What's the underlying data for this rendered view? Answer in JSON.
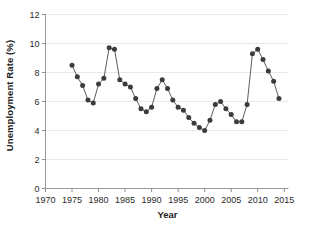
{
  "chart_data": {
    "type": "scatter",
    "title": "",
    "xlabel": "Year",
    "ylabel": "Unemployment Rate (%)",
    "xlim": [
      1970,
      2015.8
    ],
    "ylim": [
      0,
      12
    ],
    "xticks": [
      1970,
      1975,
      1980,
      1985,
      1990,
      1995,
      2000,
      2005,
      2010,
      2015
    ],
    "xtick_labels": [
      "1970",
      "1975",
      "1980",
      "1985",
      "1990",
      "1995",
      "2000",
      "2005",
      "2010",
      "2015"
    ],
    "yticks": [
      0,
      2,
      4,
      6,
      8,
      10,
      12
    ],
    "ytick_labels": [
      "0",
      "2",
      "4",
      "6",
      "8",
      "10",
      "12"
    ],
    "grid": "horizontal",
    "legend": "none",
    "marker": "filled-circle",
    "marker_color": "#3c3c3c",
    "line_color": "#4a4a4a",
    "grid_color": "#e9e9e9",
    "axis_color": "#9a9a9a",
    "x": [
      1975,
      1976,
      1977,
      1978,
      1979,
      1980,
      1981,
      1982,
      1983,
      1984,
      1985,
      1986,
      1987,
      1988,
      1989,
      1990,
      1991,
      1992,
      1993,
      1994,
      1995,
      1996,
      1997,
      1998,
      1999,
      2000,
      2001,
      2002,
      2003,
      2004,
      2005,
      2006,
      2007,
      2008,
      2009,
      2010,
      2011,
      2012,
      2013,
      2014
    ],
    "values": [
      8.5,
      7.7,
      7.1,
      6.1,
      5.9,
      7.2,
      7.6,
      9.7,
      9.6,
      7.5,
      7.2,
      7.0,
      6.2,
      5.5,
      5.3,
      5.6,
      6.9,
      7.5,
      6.9,
      6.1,
      5.6,
      5.4,
      4.9,
      4.5,
      4.2,
      4.0,
      4.7,
      5.8,
      6.0,
      5.5,
      5.1,
      4.6,
      4.6,
      5.8,
      9.3,
      9.6,
      8.9,
      8.1,
      7.4,
      6.2
    ]
  }
}
